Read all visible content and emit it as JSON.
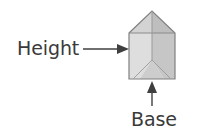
{
  "figure": {
    "type": "geometry-diagram",
    "background_color": "#ffffff",
    "labels": {
      "height": "Height",
      "base": "Base"
    },
    "label_color": "#3a3a3a",
    "annotations": [
      {
        "name": "height-annotation",
        "text": "Height",
        "arrow": "horizontal-right",
        "points_to": "left-vertical-face-of-prism"
      },
      {
        "name": "base-annotation",
        "text": "Base",
        "arrow": "vertical-up",
        "points_to": "bottom-face-of-prism"
      }
    ],
    "shape": {
      "name": "triangular-prism",
      "outline_color": "#7d7d7d",
      "faces": [
        {
          "name": "top-left-roof-face",
          "fill": "#cfcfcf"
        },
        {
          "name": "top-right-roof-face",
          "fill": "#bdbdbd"
        },
        {
          "name": "front-left-face",
          "fill": "#dcdcdc"
        },
        {
          "name": "front-right-face",
          "fill": "#c4c4c4"
        },
        {
          "name": "bottom-shadow-face",
          "fill": "#d2d2d2"
        }
      ],
      "interior_edges": [
        "apex-ridge-vertical",
        "base-vertex-y-junction"
      ]
    }
  }
}
